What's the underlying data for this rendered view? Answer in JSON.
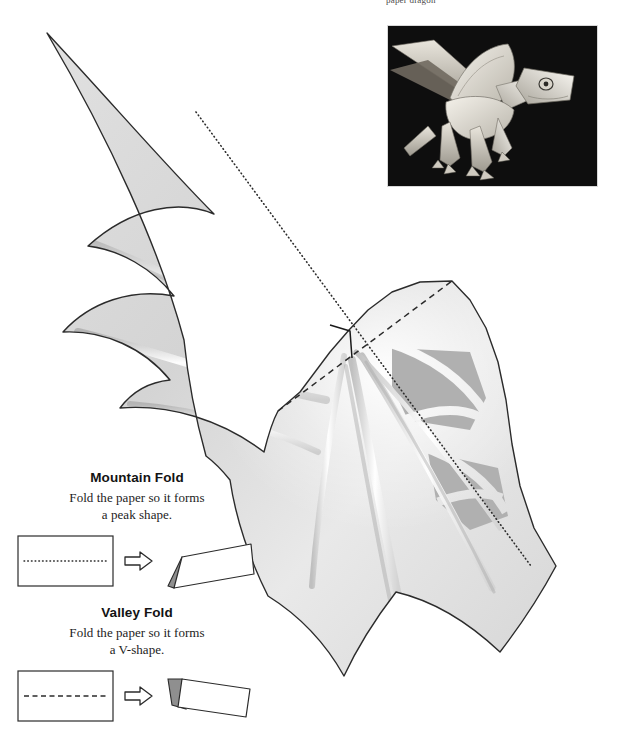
{
  "page": {
    "running_head": "paper dragon",
    "background_color": "#ffffff"
  },
  "photo": {
    "name": "finished-paper-dragon-photo",
    "subject": "Assembled paper dragon model with outstretched wings",
    "background_color": "#0d0d0d",
    "paper_color": "#efeae2",
    "shadow_color": "#8d8a83"
  },
  "template": {
    "name": "dragon-wing-cut-template",
    "outline_color": "#2b2b2b",
    "paper_fill_light": "#f3f3f3",
    "paper_fill_mid": "#d8d8d8",
    "paper_fill_dark": "#c2c2c2",
    "panel_gray": "#b3b3b3",
    "rib_highlight": "#ffffff",
    "fold_lines": [
      {
        "type": "mountain",
        "style": "dotted",
        "color": "#2b2b2b",
        "from": [
          196,
          112
        ],
        "to": [
          531,
          566
        ]
      },
      {
        "type": "valley",
        "style": "dashed",
        "color": "#2b2b2b",
        "from": [
          278,
          411
        ],
        "to": [
          452,
          281
        ]
      }
    ],
    "center_notch": {
      "label": "center-cut-notch",
      "color": "#1a1a1a",
      "at": [
        349,
        330
      ]
    }
  },
  "legend": {
    "mountain": {
      "title": "Mountain Fold",
      "line1": "Fold the paper so it forms",
      "line2": "a peak shape.",
      "line_style": "dotted",
      "before_shape": "flat-rectangle",
      "after_shape": "peak-tent",
      "arrow": "right-arrow"
    },
    "valley": {
      "title": "Valley Fold",
      "line1": "Fold the paper so it forms",
      "line2": "a V-shape.",
      "line_style": "dashed",
      "before_shape": "flat-rectangle",
      "after_shape": "valley-tent",
      "arrow": "right-arrow"
    }
  }
}
